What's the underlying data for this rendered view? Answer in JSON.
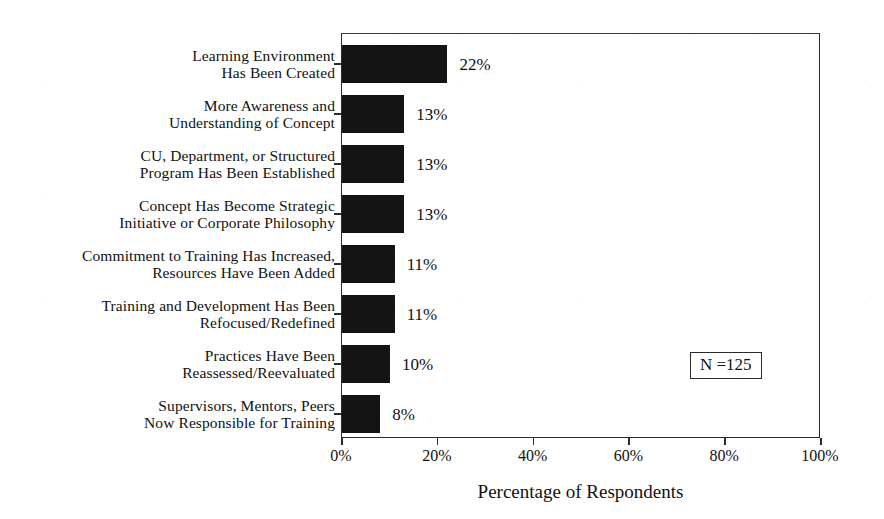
{
  "chart_data": {
    "type": "bar",
    "orientation": "horizontal",
    "title": "",
    "xlabel": "Percentage of Respondents",
    "ylabel": "",
    "xlim": [
      0,
      100
    ],
    "xticks": [
      "0%",
      "20%",
      "40%",
      "60%",
      "80%",
      "100%"
    ],
    "xtick_values": [
      0,
      20,
      40,
      60,
      80,
      100
    ],
    "grid": false,
    "legend": null,
    "categories": [
      "Learning Environment\nHas Been Created",
      "More Awareness and\nUnderstanding of Concept",
      "CU, Department, or Structured\nProgram Has Been Established",
      "Concept Has Become Strategic\nInitiative or Corporate Philosophy",
      "Commitment to Training Has Increased,\nResources Have Been Added",
      "Training and Development Has Been\nRefocused/Redefined",
      "Practices Have Been\nReassessed/Reevaluated",
      "Supervisors, Mentors, Peers\nNow Responsible for Training"
    ],
    "values": [
      22,
      13,
      13,
      13,
      11,
      11,
      10,
      8
    ],
    "value_labels": [
      "22%",
      "13%",
      "13%",
      "13%",
      "11%",
      "11%",
      "10%",
      "8%"
    ],
    "bar_color": "#141414",
    "annotation": "N =125"
  },
  "annotation": {
    "sample_size_label": "N =125"
  },
  "axis": {
    "x_title": "Percentage of Respondents"
  }
}
